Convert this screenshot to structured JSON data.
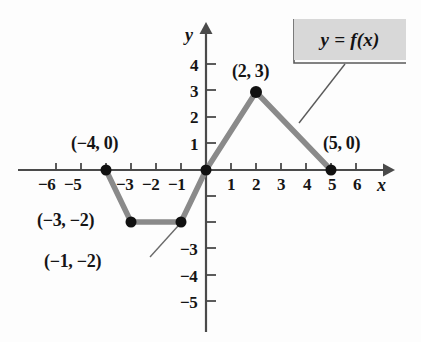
{
  "chart_data": {
    "type": "line",
    "title": "",
    "xlabel": "x",
    "ylabel": "y",
    "xlim": [
      -7,
      7
    ],
    "ylim": [
      -5.8,
      4.8
    ],
    "grid": false,
    "legend_position": "top-right",
    "series": [
      {
        "name": "y = f(x)",
        "x": [
          -4,
          -3,
          -1,
          0,
          2,
          5
        ],
        "y": [
          0,
          -2,
          -2,
          0,
          3,
          0
        ]
      }
    ],
    "marked_points": [
      {
        "label": "(−4, 0)",
        "x": -4,
        "y": 0
      },
      {
        "label": "(−3, −2)",
        "x": -3,
        "y": -2
      },
      {
        "label": "(−1, −2)",
        "x": -1,
        "y": -2
      },
      {
        "label": "(2, 3)",
        "x": 2,
        "y": 3
      },
      {
        "label": "(5, 0)",
        "x": 5,
        "y": 0
      }
    ],
    "x_ticks": [
      -6,
      -5,
      -4,
      -3,
      -2,
      -1,
      1,
      2,
      3,
      4,
      5,
      6
    ],
    "x_tick_labels": [
      "−6",
      "−5",
      "",
      "−3",
      "−2",
      "−1",
      "1",
      "2",
      "3",
      "4",
      "5",
      "6"
    ],
    "y_ticks": [
      4,
      3,
      2,
      1,
      -1,
      -2,
      -3,
      -4,
      -5
    ],
    "y_tick_labels": [
      "4",
      "3",
      "2",
      "1",
      "",
      "",
      "−3",
      "−4",
      "−5"
    ],
    "colors": {
      "curve": "#8a8a8a",
      "axis": "#4a4a4a",
      "point": "#111111",
      "legend_background": "#d8d8d8",
      "text": "#151515"
    }
  },
  "legend": {
    "text": "y = f(x)"
  },
  "axes": {
    "x_name": "x",
    "y_name": "y"
  },
  "x_tick_labels": [
    {
      "text": "−6",
      "left": 38,
      "top": 176
    },
    {
      "text": "−5",
      "left": 64,
      "top": 176
    },
    {
      "text": "−3",
      "left": 116,
      "top": 176
    },
    {
      "text": "−2",
      "left": 142,
      "top": 176
    },
    {
      "text": "−1",
      "left": 168,
      "top": 176
    },
    {
      "text": "1",
      "left": 227,
      "top": 176
    },
    {
      "text": "2",
      "left": 252,
      "top": 176
    },
    {
      "text": "3",
      "left": 277,
      "top": 176
    },
    {
      "text": "4",
      "left": 303,
      "top": 176
    },
    {
      "text": "5",
      "left": 328,
      "top": 176
    },
    {
      "text": "6",
      "left": 353,
      "top": 176
    }
  ],
  "y_tick_labels": [
    {
      "text": "4",
      "left": 190,
      "top": 57
    },
    {
      "text": "3",
      "left": 190,
      "top": 83
    },
    {
      "text": "2",
      "left": 190,
      "top": 109
    },
    {
      "text": "1",
      "left": 190,
      "top": 136
    },
    {
      "text": "−3",
      "left": 180,
      "top": 241
    },
    {
      "text": "−4",
      "left": 180,
      "top": 268
    },
    {
      "text": "−5",
      "left": 180,
      "top": 294
    }
  ],
  "point_labels": [
    {
      "name": "point-label-neg4-0",
      "text": "(−4, 0)",
      "left": 71,
      "top": 134
    },
    {
      "name": "point-label-neg3-neg2",
      "text": "(−3, −2)",
      "left": 37,
      "top": 211
    },
    {
      "name": "point-label-neg1-neg2",
      "text": "(−1, −2)",
      "left": 44,
      "top": 252
    },
    {
      "name": "point-label-2-3",
      "text": "(2, 3)",
      "left": 232,
      "top": 62
    },
    {
      "name": "point-label-5-0",
      "text": "(5, 0)",
      "left": 323,
      "top": 134
    }
  ]
}
